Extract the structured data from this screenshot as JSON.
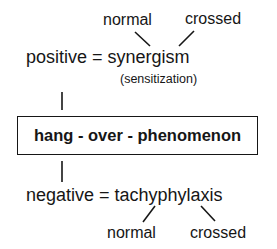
{
  "diagram": {
    "top_branch": {
      "left_label": "normal",
      "right_label": "crossed"
    },
    "positive": {
      "text": "positive = synergism",
      "note": "(sensitization)"
    },
    "center_box": {
      "text": "hang - over - phenomenon"
    },
    "negative": {
      "text": "negative = tachyphylaxis"
    },
    "bottom_branch": {
      "left_label": "normal",
      "right_label": "crossed"
    },
    "colors": {
      "ink": "#161616",
      "background": "#ffffff"
    }
  }
}
